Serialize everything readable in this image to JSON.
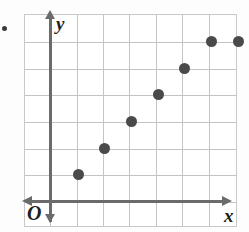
{
  "figure": {
    "axis_labels": {
      "x": "x",
      "y": "y",
      "origin": "O"
    },
    "colors": {
      "point": "#4a4a4a",
      "axis": "#6b6b6b",
      "grid": "#c4c4c4",
      "background": "#ffffff"
    },
    "bullet_marker": "item-bullet-dot"
  },
  "chart_data": {
    "type": "scatter",
    "title": "",
    "xlabel": "x",
    "ylabel": "y",
    "grid": true,
    "legend": "none",
    "xlim": [
      0,
      8
    ],
    "ylim": [
      0,
      8
    ],
    "x_tick_labels": [],
    "y_tick_labels": [],
    "x": [
      2,
      3,
      4,
      5,
      6,
      7,
      8
    ],
    "y": [
      2,
      3,
      4,
      5,
      6,
      7,
      7
    ],
    "points": [
      {
        "x": 2,
        "y": 2
      },
      {
        "x": 3,
        "y": 3
      },
      {
        "x": 4,
        "y": 4
      },
      {
        "x": 5,
        "y": 5
      },
      {
        "x": 6,
        "y": 6
      },
      {
        "x": 7,
        "y": 7
      },
      {
        "x": 8,
        "y": 7
      }
    ],
    "annotations": []
  }
}
